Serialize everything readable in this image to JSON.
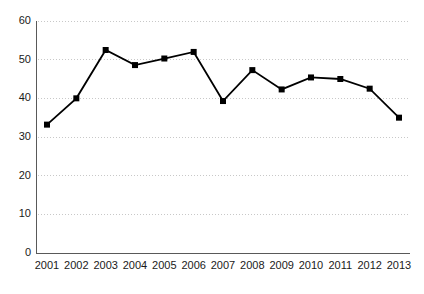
{
  "chart_data": {
    "type": "line",
    "title": "",
    "subtitle": "",
    "xlabel": "",
    "ylabel": "",
    "categories": [
      "2001",
      "2002",
      "2003",
      "2004",
      "2005",
      "2006",
      "2007",
      "2008",
      "2009",
      "2010",
      "2011",
      "2012",
      "2013"
    ],
    "values": [
      33.2,
      40.0,
      52.5,
      48.6,
      50.3,
      52.0,
      39.3,
      47.3,
      42.3,
      45.4,
      45.0,
      42.5,
      35.0
    ],
    "series": [
      {
        "name": "",
        "values": [
          33.2,
          40.0,
          52.5,
          48.6,
          50.3,
          52.0,
          39.3,
          47.3,
          42.3,
          45.4,
          45.0,
          42.5,
          35.0
        ]
      }
    ],
    "ylim": [
      0,
      60
    ],
    "xlim": [
      0,
      12
    ],
    "yticks": [
      0,
      10,
      20,
      30,
      40,
      50,
      60
    ],
    "ytick_labels": [
      "0",
      "10",
      "20",
      "30",
      "40",
      "50",
      "60"
    ],
    "xtick_labels": [
      "2001",
      "2002",
      "2003",
      "2004",
      "2005",
      "2006",
      "2007",
      "2008",
      "2009",
      "2010",
      "2011",
      "2012",
      "2013"
    ],
    "grid": true,
    "grid_axis": "y",
    "grid_style": "dotted",
    "legend": false,
    "legend_position": "none",
    "marker": "square",
    "line_color": "#000000",
    "marker_color": "#000000",
    "grid_color": "#c8c8c8",
    "axis_color": "#595959",
    "background_color": "#ffffff",
    "annotations": []
  },
  "axes": {
    "y_axis_name": "y-axis",
    "x_axis_name": "x-axis"
  }
}
